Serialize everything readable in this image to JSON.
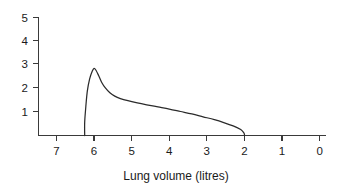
{
  "chart_data": {
    "type": "line",
    "title": "",
    "subtitle": "",
    "xlabel": "Lung volume (litres)",
    "ylabel": "",
    "grid": false,
    "legend": null,
    "x_ticks": [
      "7",
      "6",
      "5",
      "4",
      "3",
      "2",
      "1",
      "0"
    ],
    "y_ticks": [
      "1",
      "2",
      "3",
      "4",
      "5"
    ],
    "xlim": [
      7.5,
      0
    ],
    "ylim": [
      0,
      5
    ],
    "x_axis_direction": "decreasing",
    "annotations": [],
    "series": [
      {
        "name": "Expiratory flow-volume curve",
        "x": [
          6.25,
          6.25,
          6.22,
          6.18,
          6.12,
          6.05,
          6.0,
          5.95,
          5.88,
          5.8,
          5.7,
          5.58,
          5.45,
          5.3,
          5.1,
          4.85,
          4.6,
          4.3,
          4.0,
          3.7,
          3.4,
          3.1,
          2.8,
          2.55,
          2.3,
          2.1,
          2.02,
          2.0,
          2.0
        ],
        "y": [
          0.0,
          0.55,
          1.2,
          1.85,
          2.35,
          2.68,
          2.8,
          2.72,
          2.5,
          2.22,
          1.98,
          1.78,
          1.64,
          1.54,
          1.45,
          1.36,
          1.28,
          1.19,
          1.1,
          1.0,
          0.9,
          0.78,
          0.66,
          0.54,
          0.4,
          0.25,
          0.12,
          0.05,
          0.0
        ]
      }
    ]
  },
  "figure": {
    "caption": ""
  },
  "colors": {
    "curve": "#2b2b2b",
    "axis": "#3a3a3a",
    "text": "#1a1a1a",
    "background": "#ffffff"
  }
}
